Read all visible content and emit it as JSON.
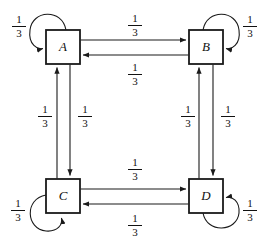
{
  "diagram": {
    "type": "state-transition-diagram",
    "title": "",
    "nodes": [
      {
        "id": "A",
        "label": "A",
        "x": 46,
        "y": 30,
        "w": 34,
        "h": 34
      },
      {
        "id": "B",
        "label": "B",
        "x": 189,
        "y": 30,
        "w": 34,
        "h": 34
      },
      {
        "id": "C",
        "label": "C",
        "x": 46,
        "y": 179,
        "w": 34,
        "h": 34
      },
      {
        "id": "D",
        "label": "D",
        "x": 189,
        "y": 179,
        "w": 34,
        "h": 34
      }
    ],
    "edges": [
      {
        "from": "A",
        "to": "A",
        "label": "1/3",
        "kind": "self-loop"
      },
      {
        "from": "B",
        "to": "B",
        "label": "1/3",
        "kind": "self-loop"
      },
      {
        "from": "C",
        "to": "C",
        "label": "1/3",
        "kind": "self-loop"
      },
      {
        "from": "D",
        "to": "D",
        "label": "1/3",
        "kind": "self-loop"
      },
      {
        "from": "A",
        "to": "B",
        "label": "1/3",
        "kind": "straight"
      },
      {
        "from": "B",
        "to": "A",
        "label": "1/3",
        "kind": "straight"
      },
      {
        "from": "C",
        "to": "D",
        "label": "1/3",
        "kind": "straight"
      },
      {
        "from": "D",
        "to": "C",
        "label": "1/3",
        "kind": "straight"
      },
      {
        "from": "C",
        "to": "A",
        "label": "1/3",
        "kind": "straight"
      },
      {
        "from": "A",
        "to": "C",
        "label": "1/3",
        "kind": "straight"
      },
      {
        "from": "D",
        "to": "B",
        "label": "1/3",
        "kind": "straight"
      },
      {
        "from": "B",
        "to": "D",
        "label": "1/3",
        "kind": "straight"
      }
    ],
    "labels": [
      {
        "id": "loop-a",
        "numerator": "1",
        "denominator": "3",
        "x": 9,
        "y": 14
      },
      {
        "id": "ab",
        "numerator": "1",
        "denominator": "3",
        "x": 125,
        "y": 13
      },
      {
        "id": "loop-b",
        "numerator": "1",
        "denominator": "3",
        "x": 240,
        "y": 14
      },
      {
        "id": "ba",
        "numerator": "1",
        "denominator": "3",
        "x": 125,
        "y": 62
      },
      {
        "id": "ca",
        "numerator": "1",
        "denominator": "3",
        "x": 35,
        "y": 104
      },
      {
        "id": "ac",
        "numerator": "1",
        "denominator": "3",
        "x": 75,
        "y": 104
      },
      {
        "id": "db",
        "numerator": "1",
        "denominator": "3",
        "x": 178,
        "y": 104
      },
      {
        "id": "bd",
        "numerator": "1",
        "denominator": "3",
        "x": 218,
        "y": 104
      },
      {
        "id": "cd",
        "numerator": "1",
        "denominator": "3",
        "x": 125,
        "y": 157
      },
      {
        "id": "loop-c",
        "numerator": "1",
        "denominator": "3",
        "x": 8,
        "y": 198
      },
      {
        "id": "dc",
        "numerator": "1",
        "denominator": "3",
        "x": 125,
        "y": 213
      },
      {
        "id": "loop-d",
        "numerator": "1",
        "denominator": "3",
        "x": 240,
        "y": 198
      }
    ],
    "colors": {
      "stroke": "#1a1a1a",
      "background": "#ffffff",
      "text": "#111111"
    }
  }
}
